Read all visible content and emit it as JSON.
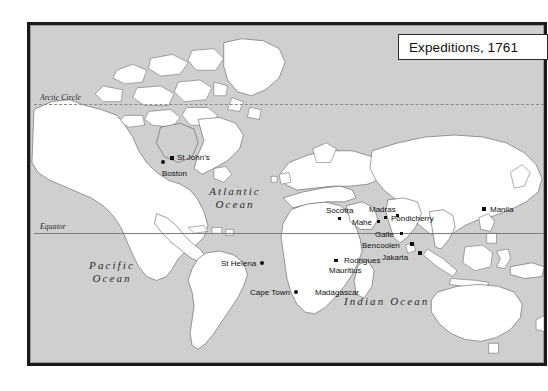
{
  "figure": {
    "kind": "world-map",
    "title": "Expeditions, 1761",
    "background_color": "#cfcfcf",
    "land_color": "#ffffff",
    "frame_color": "#1a1a1a",
    "marker_color": "#101010"
  },
  "reference_lines": [
    {
      "name": "arctic-circle",
      "label": "Arctic Circle",
      "style": "dashed"
    },
    {
      "name": "equator",
      "label": "Equator",
      "style": "solid"
    }
  ],
  "ocean_labels": [
    {
      "name": "atlantic-ocean",
      "line1": "Atlantic",
      "line2": "Ocean"
    },
    {
      "name": "pacific-ocean",
      "line1": "Pacific",
      "line2": "Ocean"
    },
    {
      "name": "indian-ocean",
      "line1": "Indian Ocean",
      "line2": ""
    }
  ],
  "places": [
    {
      "name": "st-johns",
      "label": "St John's",
      "marker": "square"
    },
    {
      "name": "boston",
      "label": "Boston",
      "marker": "dot"
    },
    {
      "name": "st-helena",
      "label": "St Helena",
      "marker": "dot"
    },
    {
      "name": "cape-town",
      "label": "Cape Town",
      "marker": "dot"
    },
    {
      "name": "madagascar",
      "label": "Madagascar",
      "marker": "none"
    },
    {
      "name": "rodrigues",
      "label": "Rodrigues",
      "marker": "square"
    },
    {
      "name": "mauritius",
      "label": "Mauritius",
      "marker": "square"
    },
    {
      "name": "socotra",
      "label": "Socotra",
      "marker": "square"
    },
    {
      "name": "mahe",
      "label": "Mahé",
      "marker": "square"
    },
    {
      "name": "madras",
      "label": "Madras",
      "marker": "square"
    },
    {
      "name": "pondicherry",
      "label": "Pondicherry",
      "marker": "square"
    },
    {
      "name": "galle",
      "label": "Galle",
      "marker": "square"
    },
    {
      "name": "bencoolen",
      "label": "Bencoolen",
      "marker": "square"
    },
    {
      "name": "jakarta",
      "label": "Jakarta",
      "marker": "square"
    },
    {
      "name": "manila",
      "label": "Manila",
      "marker": "square"
    }
  ]
}
